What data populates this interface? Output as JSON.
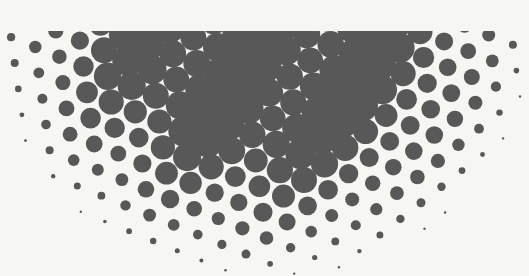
{
  "image": {
    "description": "Halftone dot pattern forming a downward semicircle; large gray dots near center, shrinking to tiny dots at the curved edge",
    "width": 529,
    "height": 276,
    "background_color": "#f6f6f3",
    "dot_color": "#585858",
    "top_cut_y": 31,
    "center_x": 262,
    "radius_x": 268,
    "radius_y": 242,
    "spacing": 26,
    "max_dot_radius": 17,
    "min_dot_radius": 1.2,
    "lattice_rotation_deg": 22
  }
}
